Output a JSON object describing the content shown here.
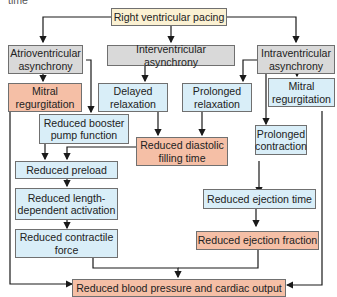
{
  "partial_text_top": "time",
  "colors": {
    "root": "#fbf1d2",
    "mechanism": "#d9d9d9",
    "intermediate": "#d9eef8",
    "outcome": "#f5bfa6",
    "line": "#1a1a1a"
  },
  "nodes": {
    "rv_pacing": "Right ventricular pacing",
    "av_async": "Atrioventricular asynchrony",
    "inter_async": "Interventricular asynchrony",
    "intra_async": "Intraventricular asynchrony",
    "mitral_left": "Mitral regurgitation",
    "delayed_relax": "Delayed relaxation",
    "prolonged_relax": "Prolonged relaxation",
    "mitral_right": "Mitral regurgitation",
    "booster": "Reduced booster pump function",
    "diastolic": "Reduced diastolic filling time",
    "prolonged_contr": "Prolonged contraction",
    "preload": "Reduced preload",
    "length_dep": "Reduced length-dependent activation",
    "ejection_time": "Reduced ejection time",
    "contractile": "Reduced contractile force",
    "ejection_fraction": "Reduced ejection fraction",
    "bp_co": "Reduced blood pressure and cardiac output"
  }
}
